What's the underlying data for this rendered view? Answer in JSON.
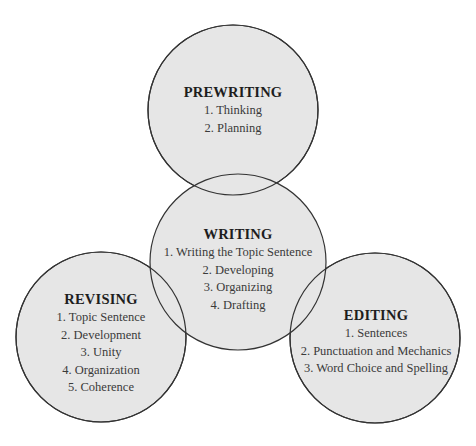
{
  "colors": {
    "fill": "#e6e6e6",
    "stroke": "#333333",
    "background": "#ffffff"
  },
  "stages": {
    "prewriting": {
      "title": "PREWRITING",
      "items": [
        "1. Thinking",
        "2. Planning"
      ]
    },
    "writing": {
      "title": "WRITING",
      "items": [
        "1. Writing the Topic Sentence",
        "2. Developing",
        "3. Organizing",
        "4. Drafting"
      ]
    },
    "revising": {
      "title": "REVISING",
      "items": [
        "1. Topic Sentence",
        "2. Development",
        "3. Unity",
        "4. Organization",
        "5. Coherence"
      ]
    },
    "editing": {
      "title": "EDITING",
      "items": [
        "1. Sentences",
        "2. Punctuation and Mechanics",
        "3. Word Choice and Spelling"
      ]
    }
  }
}
